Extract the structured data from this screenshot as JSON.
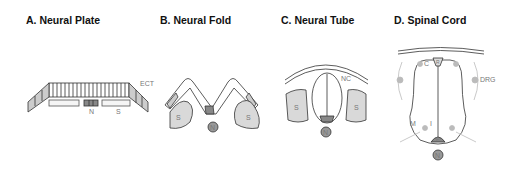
{
  "panels": [
    {
      "id": "A",
      "title": "A.  Neural Plate",
      "labels": {
        "ectoderm": "ECT",
        "notochord": "N",
        "somite": "S"
      }
    },
    {
      "id": "B",
      "title": "B.  Neural Fold",
      "labels": {
        "somite_left": "S",
        "somite_right": "S",
        "notochord": "N"
      }
    },
    {
      "id": "C",
      "title": "C.  Neural Tube",
      "labels": {
        "neural_crest": "NC",
        "somite_left": "S",
        "somite_right": "S",
        "notochord": "N"
      }
    },
    {
      "id": "D",
      "title": "D.  Spinal Cord",
      "labels": {
        "commissural": "C",
        "dorsal_root_ganglion": "DRG",
        "motor": "M",
        "interneuron": "I",
        "roof_plate": "R",
        "floor_plate": "F",
        "notochord": "N"
      }
    }
  ],
  "colors": {
    "line": "#333333",
    "fill_gray": "#d9d9d9",
    "notochord": "#999999",
    "neuron": "#bbbbbb"
  }
}
